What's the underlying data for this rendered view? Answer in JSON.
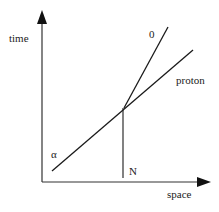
{
  "diagram": {
    "type": "spacetime-diagram",
    "axes": {
      "y_label": "time",
      "x_label": "space"
    },
    "lines": [
      {
        "id": "alpha-proton",
        "start_label": "α",
        "end_label": "proton"
      },
      {
        "id": "zero",
        "end_label": "0"
      },
      {
        "id": "N",
        "label": "N"
      }
    ],
    "labels": {
      "time": "time",
      "space": "space",
      "zero": "0",
      "proton": "proton",
      "alpha": "α",
      "N": "N"
    },
    "colors": {
      "line": "#1a1a1a",
      "axis": "#333333",
      "text": "#222222",
      "background": "#ffffff"
    }
  }
}
